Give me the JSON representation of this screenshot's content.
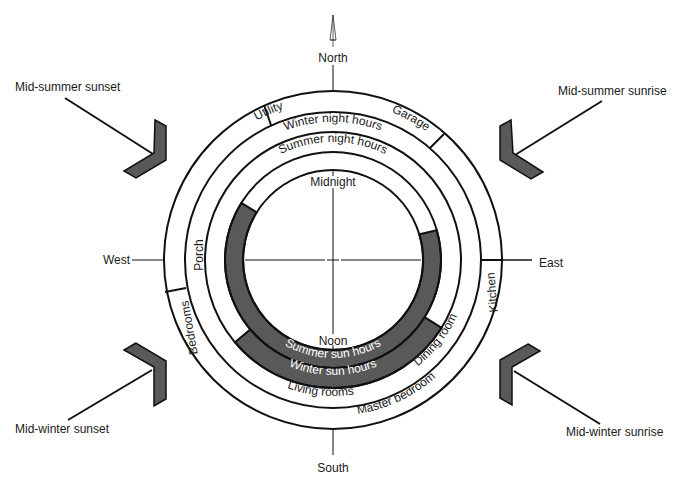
{
  "diagram": {
    "center": {
      "x": 333,
      "y": 260
    },
    "colors": {
      "stroke": "#111111",
      "sun_fill": "#595959",
      "background": "#ffffff",
      "text": "#1a1a1a",
      "sun_text": "#ffffff"
    },
    "compass": {
      "north": "North",
      "south": "South",
      "east": "East",
      "west": "West"
    },
    "clock": {
      "top": "Midnight",
      "bottom": "Noon"
    },
    "rings": {
      "summer_sun_hours": "Summer sun hours",
      "winter_sun_hours": "Winter sun hours",
      "summer_night_hours": "Summer night hours",
      "winter_night_hours": "Winter night hours"
    },
    "rooms": {
      "utility": "Utility",
      "garage": "Garage",
      "kitchen": "Kitchen",
      "dining_room": "Dining room",
      "master_bedroom": "Master bedroom",
      "living_rooms": "Living rooms",
      "bedrooms": "Bedrooms",
      "porch": "Porch"
    },
    "sun_positions": {
      "mid_summer_sunset": "Mid-summer sunset",
      "mid_summer_sunrise": "Mid-summer sunrise",
      "mid_winter_sunset": "Mid-winter sunset",
      "mid_winter_sunrise": "Mid-winter sunrise"
    }
  }
}
